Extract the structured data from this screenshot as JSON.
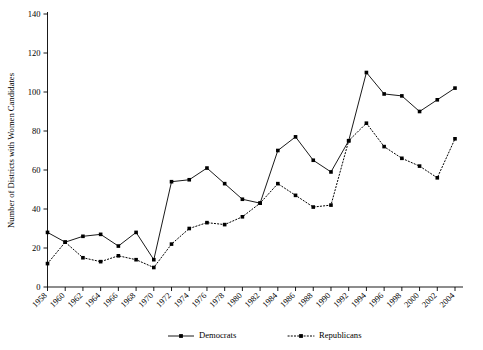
{
  "chart_data": {
    "type": "line",
    "title": "",
    "xlabel": "",
    "ylabel": "Number of Districts with Women Candidates",
    "ylim": [
      0,
      140
    ],
    "yticks": [
      0,
      20,
      40,
      60,
      80,
      100,
      120,
      140
    ],
    "grid": false,
    "legend_position": "bottom",
    "categories": [
      "1958",
      "1960",
      "1962",
      "1964",
      "1966",
      "1968",
      "1970",
      "1972",
      "1974",
      "1976",
      "1978",
      "1980",
      "1982",
      "1984",
      "1986",
      "1988",
      "1990",
      "1992",
      "1994",
      "1996",
      "1998",
      "2000",
      "2002",
      "2004"
    ],
    "series": [
      {
        "name": "Democrats",
        "style": "solid",
        "marker": "square",
        "values": [
          28,
          23,
          26,
          27,
          21,
          28,
          14,
          54,
          55,
          61,
          53,
          45,
          43,
          70,
          77,
          65,
          59,
          75,
          110,
          99,
          98,
          90,
          96,
          102
        ]
      },
      {
        "name": "Republicans",
        "style": "dotted",
        "marker": "square",
        "values": [
          12,
          23,
          15,
          13,
          16,
          14,
          10,
          22,
          30,
          33,
          32,
          36,
          43,
          53,
          47,
          41,
          42,
          75,
          84,
          72,
          66,
          62,
          56,
          76
        ]
      }
    ]
  },
  "legend": {
    "items": [
      {
        "label": "Democrats",
        "style": "solid"
      },
      {
        "label": "Republicans",
        "style": "dotted"
      }
    ]
  }
}
